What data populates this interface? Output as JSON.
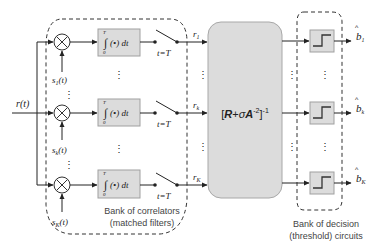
{
  "diagram": {
    "input": {
      "label": "r(t)"
    },
    "correlator_bank": {
      "caption_line1": "Bank of correlators",
      "caption_line2": "(matched filters)",
      "rows": [
        {
          "signal": "s",
          "signal_sub": "1",
          "signal_suffix": "(t)",
          "integrator": "∫(•)dt",
          "int_upper": "T",
          "int_lower": "0",
          "sample": "t=T",
          "output": "r",
          "output_sub": "1"
        },
        {
          "signal": "s",
          "signal_sub": "k",
          "signal_suffix": "(t)",
          "integrator": "∫(•)dt",
          "int_upper": "T",
          "int_lower": "0",
          "sample": "t=T",
          "output": "r",
          "output_sub": "k"
        },
        {
          "signal": "s",
          "signal_sub": "K",
          "signal_suffix": "(t)",
          "integrator": "∫(•)dt",
          "int_upper": "T",
          "int_lower": "0",
          "sample": "t=T",
          "output": "r",
          "output_sub": "K"
        }
      ],
      "ellipsis": "⋮"
    },
    "decorrelator": {
      "label_open": "[",
      "R": "R",
      "plus": "+",
      "sigma": "σ",
      "A": "A",
      "exp_inner": "-2",
      "label_close": "]",
      "exp_outer": "-1"
    },
    "decision_bank": {
      "caption_line1": "Bank of decision",
      "caption_line2": "(threshold) circuits",
      "outputs": [
        {
          "label": "b",
          "hat": "^",
          "sub": "1"
        },
        {
          "label": "b",
          "hat": "^",
          "sub": "k"
        },
        {
          "label": "b",
          "hat": "^",
          "sub": "K"
        }
      ]
    },
    "colors": {
      "box_fill": "#dcdcdc",
      "box_stroke": "#a0a0a0",
      "line": "#222222",
      "dash": "#333333",
      "caption": "#444444"
    }
  }
}
